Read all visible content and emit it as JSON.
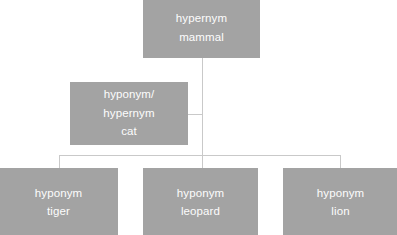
{
  "diagram": {
    "background_color": "#ffffff",
    "node_fill_color": "#a3a3a3",
    "node_text_color": "#fdfdfd",
    "connector_color": "#c9c9c9",
    "nodes": {
      "mammal": {
        "relation_label": "hypernym",
        "term": "mammal"
      },
      "cat": {
        "relation_label_1": "hyponym/",
        "relation_label_2": "hypernym",
        "term": "cat"
      },
      "tiger": {
        "relation_label": "hyponym",
        "term": "tiger"
      },
      "leopard": {
        "relation_label": "hyponym",
        "term": "leopard"
      },
      "lion": {
        "relation_label": "hyponym",
        "term": "lion"
      }
    }
  }
}
